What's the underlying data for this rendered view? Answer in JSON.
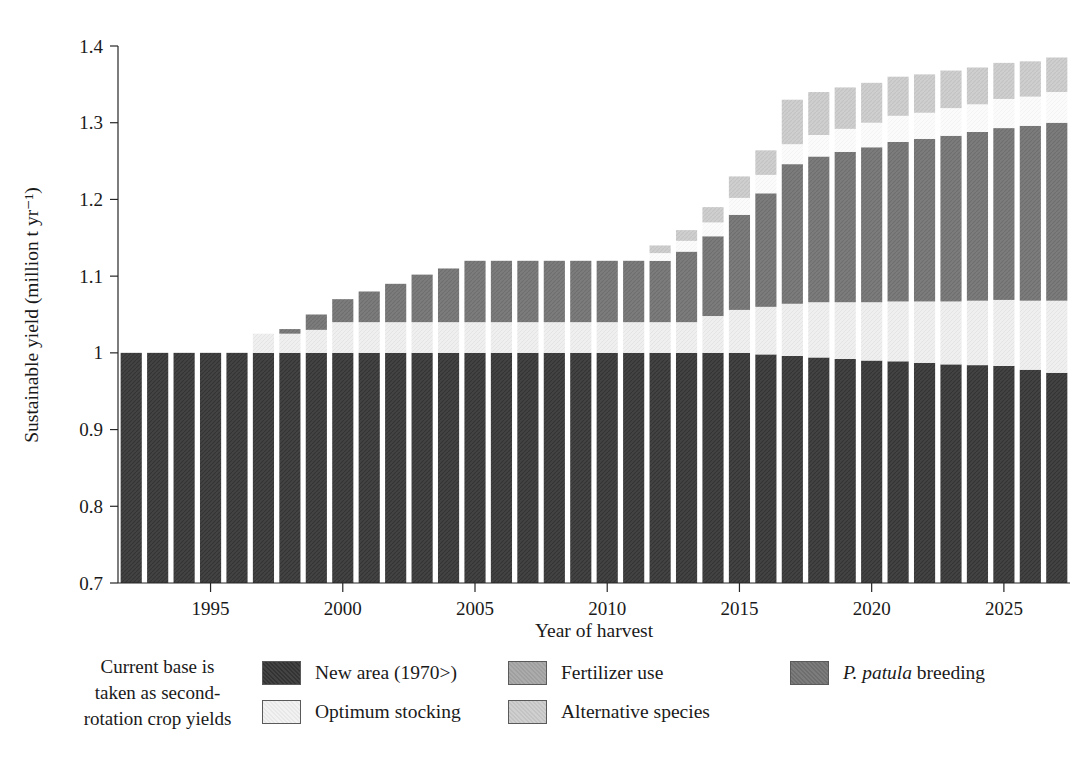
{
  "chart_data": {
    "type": "bar",
    "subtype": "stacked-bar",
    "title": "",
    "xlabel": "Year of harvest",
    "ylabel": "Sustainable yield (million t yr⁻¹)",
    "ylim": [
      0.7,
      1.4
    ],
    "ytick_labels": [
      "0.7",
      "0.8",
      "0.9",
      "1",
      "1.1",
      "1.2",
      "1.3",
      "1.4"
    ],
    "ytick_values": [
      0.7,
      0.8,
      0.9,
      1.0,
      1.1,
      1.2,
      1.3,
      1.4
    ],
    "xlim": [
      1991.5,
      2027.5
    ],
    "xtick_labels": [
      "1995",
      "2000",
      "2005",
      "2010",
      "2015",
      "2020",
      "2025"
    ],
    "xtick_values": [
      1995,
      2000,
      2005,
      2010,
      2015,
      2020,
      2025
    ],
    "grid": false,
    "legend_position": "below",
    "categories": [
      1992,
      1993,
      1994,
      1995,
      1996,
      1997,
      1998,
      1999,
      2000,
      2001,
      2002,
      2003,
      2004,
      2005,
      2006,
      2007,
      2008,
      2009,
      2010,
      2011,
      2012,
      2013,
      2014,
      2015,
      2016,
      2017,
      2018,
      2019,
      2020,
      2021,
      2022,
      2023,
      2024,
      2025,
      2026,
      2027
    ],
    "series": [
      {
        "name": "New area (1970>)",
        "color": "#434343",
        "values": [
          1.0,
          1.0,
          1.0,
          1.0,
          1.0,
          1.0,
          1.0,
          1.0,
          1.0,
          1.0,
          1.0,
          1.0,
          1.0,
          1.0,
          1.0,
          1.0,
          1.0,
          1.0,
          1.0,
          1.0,
          1.0,
          1.0,
          1.0,
          1.0,
          0.998,
          0.996,
          0.994,
          0.992,
          0.99,
          0.989,
          0.987,
          0.985,
          0.984,
          0.983,
          0.978,
          0.974
        ]
      },
      {
        "name": "Optimum stocking",
        "color": "#efefef",
        "values": [
          0.0,
          0.0,
          0.0,
          0.0,
          0.0,
          0.025,
          0.025,
          0.03,
          0.04,
          0.04,
          0.04,
          0.04,
          0.04,
          0.04,
          0.04,
          0.04,
          0.04,
          0.04,
          0.04,
          0.04,
          0.04,
          0.04,
          0.048,
          0.056,
          0.062,
          0.068,
          0.072,
          0.074,
          0.076,
          0.078,
          0.08,
          0.082,
          0.084,
          0.086,
          0.09,
          0.094
        ]
      },
      {
        "name": "P. patula breeding",
        "color": "#7c7c7c",
        "values": [
          0.0,
          0.0,
          0.0,
          0.0,
          0.0,
          0.0,
          0.006,
          0.02,
          0.03,
          0.04,
          0.05,
          0.062,
          0.07,
          0.08,
          0.08,
          0.08,
          0.08,
          0.08,
          0.08,
          0.08,
          0.08,
          0.092,
          0.104,
          0.124,
          0.148,
          0.182,
          0.19,
          0.196,
          0.202,
          0.208,
          0.212,
          0.216,
          0.22,
          0.224,
          0.228,
          0.232
        ]
      },
      {
        "name": "Fertilizer use",
        "color": "#fbfbfb",
        "values": [
          0.0,
          0.0,
          0.0,
          0.0,
          0.0,
          0.0,
          0.0,
          0.0,
          0.0,
          0.0,
          0.0,
          0.0,
          0.0,
          0.0,
          0.0,
          0.0,
          0.0,
          0.0,
          0.0,
          0.0,
          0.01,
          0.014,
          0.018,
          0.022,
          0.024,
          0.026,
          0.028,
          0.03,
          0.032,
          0.034,
          0.034,
          0.036,
          0.036,
          0.038,
          0.038,
          0.04
        ]
      },
      {
        "name": "Alternative species",
        "color": "#cfcfcf",
        "values": [
          0.0,
          0.0,
          0.0,
          0.0,
          0.0,
          0.0,
          0.0,
          0.0,
          0.0,
          0.0,
          0.0,
          0.0,
          0.0,
          0.0,
          0.0,
          0.0,
          0.0,
          0.0,
          0.0,
          0.0,
          0.01,
          0.014,
          0.02,
          0.028,
          0.032,
          0.058,
          0.056,
          0.054,
          0.052,
          0.051,
          0.05,
          0.049,
          0.048,
          0.047,
          0.046,
          0.045
        ]
      }
    ],
    "totals": [
      1.0,
      1.0,
      1.0,
      1.0,
      1.0,
      1.025,
      1.031,
      1.05,
      1.07,
      1.08,
      1.09,
      1.102,
      1.11,
      1.12,
      1.12,
      1.12,
      1.12,
      1.12,
      1.12,
      1.12,
      1.14,
      1.16,
      1.19,
      1.23,
      1.264,
      1.33,
      1.34,
      1.346,
      1.352,
      1.36,
      1.363,
      1.368,
      1.372,
      1.378,
      1.38,
      1.385
    ]
  },
  "legend": {
    "note_lines": [
      "Current base is",
      "taken as second-",
      "rotation crop yields"
    ],
    "entries": [
      {
        "label": "New area (1970>)",
        "color": "#434343",
        "italic_prefix": ""
      },
      {
        "label": "Optimum stocking",
        "color": "#efefef",
        "italic_prefix": ""
      },
      {
        "label": "Fertilizer use",
        "color": "#aaaaaa",
        "italic_prefix": ""
      },
      {
        "label": "Alternative species",
        "color": "#cfcfcf",
        "italic_prefix": ""
      },
      {
        "label": " breeding",
        "color": "#7c7c7c",
        "italic_prefix": "P. patula"
      }
    ]
  }
}
